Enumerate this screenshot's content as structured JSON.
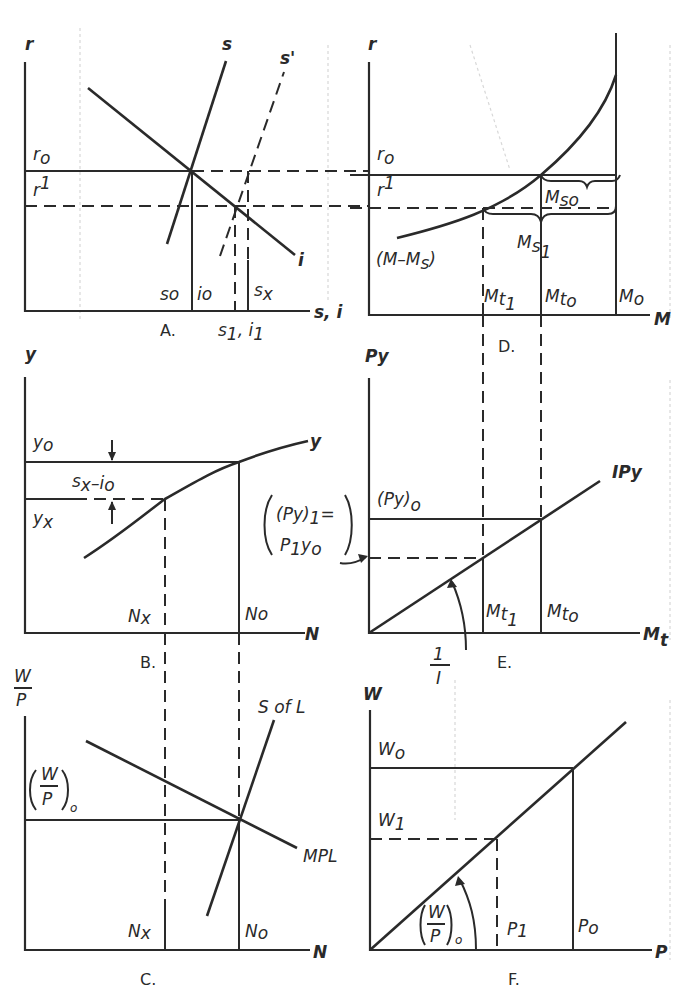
{
  "figure": {
    "panels": [
      {
        "id": "A",
        "caption": "A.",
        "y_axis": "r",
        "x_axis": "s, i",
        "labels": {
          "r0": "r",
          "r0_sub": "o",
          "r1": "r",
          "r1_sub": "1",
          "s": "s",
          "s_prime": "s'",
          "i": "i",
          "s0": "s",
          "s0_sub": "o",
          "i0": "i",
          "i0_sub": "o",
          "sx": "s",
          "sx_sub": "x",
          "s1i1": "s",
          "s1i1_sub1": "1",
          "s1i1_mid": ", i",
          "s1i1_sub2": "1"
        }
      },
      {
        "id": "D",
        "caption": "D.",
        "y_axis": "r",
        "x_axis": "M",
        "labels": {
          "r0": "r",
          "r0_sub": "o",
          "r1": "r",
          "r1_sub": "1",
          "curve": "(M–M",
          "curve_sub": "s",
          "curve_end": ")",
          "Ms0": "M",
          "Ms0_sub": "so",
          "Ms1": "M",
          "Ms1_sub": "s",
          "Ms1_sub2": "1",
          "Mt1": "M",
          "Mt1_sub": "t",
          "Mt1_sub2": "1",
          "Mt0": "M",
          "Mt0_sub": "t",
          "Mt0_sub2": "o",
          "M0": "M",
          "M0_sub": "o"
        }
      },
      {
        "id": "B",
        "caption": "B.",
        "y_axis": "y",
        "x_axis": "N",
        "labels": {
          "curve": "y",
          "y0": "y",
          "y0_sub": "o",
          "yx": "y",
          "yx_sub": "x",
          "gap": "s",
          "gap_sub1": "x",
          "gap_mid": "–i",
          "gap_sub2": "o",
          "Nx": "N",
          "Nx_sub": "x",
          "N0": "N",
          "N0_sub": "o"
        }
      },
      {
        "id": "E",
        "caption": "E.",
        "y_axis": "Py",
        "x_axis": "M",
        "x_axis_sub": "t",
        "labels": {
          "line": "IPy",
          "Py0": "(Py)",
          "Py0_sub": "o",
          "Py1_top": "(Py)",
          "Py1_top_sub": "1",
          "Py1_eq": "=",
          "Py1_bottom": "P",
          "Py1_bottom_sub": "1",
          "Py1_bottom_end": "y",
          "Py1_bottom_sub2": "o",
          "slope_num": "1",
          "slope_den": "I",
          "Mt1": "M",
          "Mt1_sub": "t",
          "Mt1_sub2": "1",
          "Mt0": "M",
          "Mt0_sub": "t",
          "Mt0_sub2": "o"
        }
      },
      {
        "id": "C",
        "caption": "C.",
        "y_axis_num": "W",
        "y_axis_den": "P",
        "x_axis": "N",
        "labels": {
          "supply": "S of L",
          "demand": "MPL",
          "wp_num": "W",
          "wp_den": "P",
          "wp_sub": "o",
          "Nx": "N",
          "Nx_sub": "x",
          "N0": "N",
          "N0_sub": "o"
        }
      },
      {
        "id": "F",
        "caption": "F.",
        "y_axis": "W",
        "x_axis": "P",
        "labels": {
          "W0": "W",
          "W0_sub": "o",
          "W1": "W",
          "W1_sub": "1",
          "slope_num": "W",
          "slope_den": "P",
          "slope_sub": "o",
          "P1": "P",
          "P1_sub": "1",
          "P0": "P",
          "P0_sub": "o"
        }
      }
    ]
  }
}
